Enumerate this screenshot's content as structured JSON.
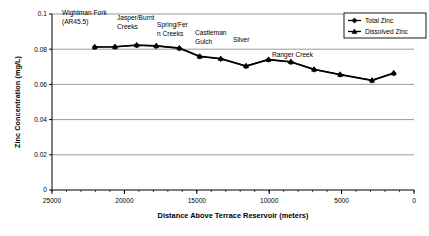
{
  "chart_data": {
    "type": "line",
    "title": "",
    "xlabel": "Distance Above Terrace Reservoir (meters)",
    "ylabel": "Zinc Concentration (mg/L)",
    "xlim": [
      25000,
      0
    ],
    "ylim": [
      0,
      0.1
    ],
    "x_reversed": true,
    "grid": "horizontal",
    "legend_position": "top-right",
    "xticks": [
      25000,
      20000,
      15000,
      10000,
      5000,
      0
    ],
    "xtick_labels": [
      "25000",
      "20000",
      "15000",
      "10000",
      "5000",
      "0"
    ],
    "x_minor_tick_interval": 1000,
    "yticks": [
      0,
      0.02,
      0.04,
      0.06,
      0.08,
      0.1
    ],
    "ytick_labels": [
      "0",
      "0.02",
      "0.04",
      "0.06",
      "0.08",
      "0.1"
    ],
    "x": [
      22050,
      20650,
      19150,
      17800,
      16200,
      14800,
      13350,
      11600,
      10050,
      8500,
      6900,
      5100,
      2900,
      1400
    ],
    "series": [
      {
        "name": "Total Zinc",
        "marker": "diamond",
        "values": [
          0.0812,
          0.0813,
          0.0822,
          0.0818,
          0.0805,
          0.0758,
          0.0745,
          0.0703,
          0.074,
          0.0727,
          0.0684,
          0.0655,
          0.0622,
          0.0663
        ]
      },
      {
        "name": "Dissolved Zinc",
        "marker": "triangle",
        "values": [
          0.0813,
          0.0814,
          0.0824,
          0.082,
          0.0807,
          0.076,
          0.0747,
          0.0705,
          0.0742,
          0.0729,
          0.0686,
          0.0657,
          0.0624,
          0.0665
        ]
      }
    ],
    "annotations": [
      {
        "id": "wightman-fork",
        "lines": [
          "Wightman Fork",
          "(AR45.5)"
        ],
        "x_px": 62,
        "y_px": 15
      },
      {
        "id": "jasper-burnt-creeks",
        "lines": [
          "Jasper/Burnt",
          "Creeks"
        ],
        "x_px": 117,
        "y_px": 20
      },
      {
        "id": "spring-fern-creeks",
        "lines": [
          "Spring/Fer",
          "n Creeks"
        ],
        "x_px": 157,
        "y_px": 27
      },
      {
        "id": "castleman-gulch",
        "lines": [
          "Castleman",
          "Gulch"
        ],
        "x_px": 195,
        "y_px": 35
      },
      {
        "id": "silver",
        "lines": [
          "Silver"
        ],
        "x_px": 233,
        "y_px": 42
      },
      {
        "id": "ranger-creek",
        "lines": [
          "Ranger Creek"
        ],
        "x_px": 272,
        "y_px": 57
      }
    ],
    "colors": {
      "line": "#000000",
      "axis": "#000000",
      "grid": "#808080",
      "background": "#ffffff"
    }
  }
}
